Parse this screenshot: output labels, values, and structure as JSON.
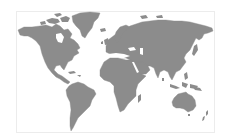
{
  "map": {
    "type": "world-map",
    "style": "grayscale silhouette",
    "colors": {
      "land": "#8c8c8c",
      "ocean": "#ffffff",
      "frame_border": "#ececec"
    },
    "regions": [
      {
        "name": "North America"
      },
      {
        "name": "Greenland"
      },
      {
        "name": "South America"
      },
      {
        "name": "Europe"
      },
      {
        "name": "Asia"
      },
      {
        "name": "Africa"
      },
      {
        "name": "Australia"
      },
      {
        "name": "Antarctica-excluded"
      }
    ]
  }
}
